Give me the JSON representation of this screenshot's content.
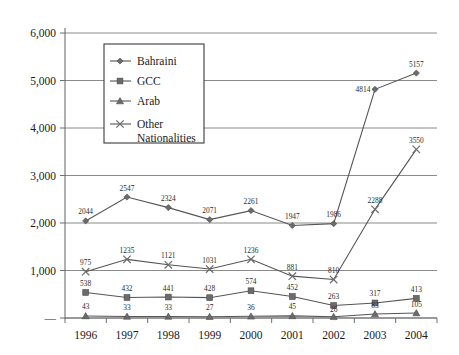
{
  "chart_data": {
    "type": "line",
    "title": "",
    "xlabel": "",
    "ylabel": "",
    "categories": [
      "1996",
      "1997",
      "1998",
      "1999",
      "2000",
      "2001",
      "2002",
      "2003",
      "2004"
    ],
    "ylim": [
      0,
      6000
    ],
    "ytick_labels": [
      "—",
      "1,000",
      "2,000",
      "3,000",
      "4,000",
      "5,000",
      "6,000"
    ],
    "ytick_values": [
      0,
      1000,
      2000,
      3000,
      4000,
      5000,
      6000
    ],
    "grid": true,
    "legend_position": "upper-left-inside",
    "series": [
      {
        "name": "Bahraini",
        "marker": "diamond",
        "values": [
          2044,
          2547,
          2324,
          2071,
          2261,
          1947,
          1986,
          4814,
          5157
        ],
        "labels": [
          "2044",
          "2547",
          "2324",
          "2071",
          "2261",
          "1947",
          "1986",
          "4814",
          "5157"
        ]
      },
      {
        "name": "GCC",
        "marker": "square",
        "values": [
          538,
          432,
          441,
          428,
          574,
          452,
          263,
          317,
          413
        ],
        "labels": [
          "538",
          "432",
          "441",
          "428",
          "574",
          "452",
          "263",
          "317",
          "413"
        ]
      },
      {
        "name": "Arab",
        "marker": "triangle",
        "values": [
          43,
          33,
          33,
          27,
          36,
          45,
          26,
          83,
          105
        ],
        "labels": [
          "43",
          "33",
          "33",
          "27",
          "36",
          "45",
          "26",
          "83",
          "105"
        ]
      },
      {
        "name": "Other Nationalities",
        "marker": "x",
        "values": [
          975,
          1235,
          1121,
          1031,
          1236,
          881,
          810,
          2288,
          3550
        ],
        "labels": [
          "975",
          "1235",
          "1121",
          "1031",
          "1236",
          "881",
          "810",
          "2288",
          "3550"
        ]
      }
    ],
    "legend_entries": [
      {
        "label": "Bahraini",
        "marker": "diamond"
      },
      {
        "label": "GCC",
        "marker": "square"
      },
      {
        "label": "Arab",
        "marker": "triangle"
      },
      {
        "label": "Other",
        "label2": "Nationalities",
        "marker": "x"
      }
    ],
    "colors": {
      "line": "#555555",
      "marker": "#6b6b6b",
      "grid": "#8a8a8a",
      "axis": "#6f6f6f",
      "text": "#1a1a1a",
      "background": "#ffffff"
    }
  }
}
